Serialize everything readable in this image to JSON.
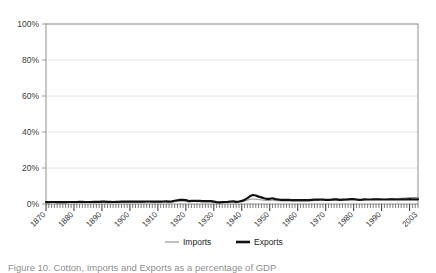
{
  "figure": {
    "caption": "Figure 10. Cotton, Imports and Exports as a percentage of GDP"
  },
  "legend": {
    "position": "bottom-center",
    "entries": [
      {
        "label": "Imports",
        "marker": "thin-line",
        "color": "#8c8c8c"
      },
      {
        "label": "Exports",
        "marker": "thick-line",
        "color": "#111111"
      }
    ]
  },
  "axes": {
    "y_ticks": [
      "0%",
      "20%",
      "40%",
      "60%",
      "80%",
      "100%"
    ],
    "x_ticks": [
      "1870",
      "1880",
      "1890",
      "1900",
      "1910",
      "1920",
      "1930",
      "1940",
      "1950",
      "1960",
      "1970",
      "1980",
      "1990",
      "2003"
    ]
  },
  "colors": {
    "imports": "#8c8c8c",
    "exports": "#111111",
    "grid": "#e2e2e2",
    "frame": "#9a9a9a",
    "text": "#3a3a3a",
    "background": "#ffffff"
  },
  "chart_data": {
    "type": "line",
    "title": "",
    "xlabel": "",
    "ylabel": "",
    "ylim": [
      0,
      100
    ],
    "xlim": [
      1870,
      2003
    ],
    "grid": true,
    "legend_position": "bottom-center",
    "y_tick_values": [
      0,
      20,
      40,
      60,
      80,
      100
    ],
    "x_tick_values": [
      1870,
      1880,
      1890,
      1900,
      1910,
      1920,
      1930,
      1940,
      1950,
      1960,
      1970,
      1980,
      1990,
      2003
    ],
    "x": [
      1870,
      1871,
      1872,
      1873,
      1874,
      1875,
      1876,
      1877,
      1878,
      1879,
      1880,
      1881,
      1882,
      1883,
      1884,
      1885,
      1886,
      1887,
      1888,
      1889,
      1890,
      1891,
      1892,
      1893,
      1894,
      1895,
      1896,
      1897,
      1898,
      1899,
      1900,
      1901,
      1902,
      1903,
      1904,
      1905,
      1906,
      1907,
      1908,
      1909,
      1910,
      1911,
      1912,
      1913,
      1914,
      1915,
      1916,
      1917,
      1918,
      1919,
      1920,
      1921,
      1922,
      1923,
      1924,
      1925,
      1926,
      1927,
      1928,
      1929,
      1930,
      1931,
      1932,
      1933,
      1934,
      1935,
      1936,
      1937,
      1938,
      1939,
      1940,
      1941,
      1942,
      1943,
      1944,
      1945,
      1946,
      1947,
      1948,
      1949,
      1950,
      1951,
      1952,
      1953,
      1954,
      1955,
      1956,
      1957,
      1958,
      1959,
      1960,
      1961,
      1962,
      1963,
      1964,
      1965,
      1966,
      1967,
      1968,
      1969,
      1970,
      1971,
      1972,
      1973,
      1974,
      1975,
      1976,
      1977,
      1978,
      1979,
      1980,
      1981,
      1982,
      1983,
      1984,
      1985,
      1986,
      1987,
      1988,
      1989,
      1990,
      1991,
      1992,
      1993,
      1994,
      1995,
      1996,
      1997,
      1998,
      1999,
      2000,
      2001,
      2002,
      2003
    ],
    "series": [
      {
        "name": "Imports",
        "color": "#8c8c8c",
        "line_width": 1,
        "values": [
          0.7,
          0.7,
          0.8,
          0.8,
          0.7,
          0.7,
          0.7,
          0.7,
          0.8,
          0.8,
          0.8,
          0.8,
          0.9,
          0.9,
          0.8,
          0.8,
          0.8,
          0.9,
          0.9,
          0.9,
          1.0,
          1.0,
          0.9,
          0.9,
          0.8,
          0.9,
          0.9,
          1.0,
          1.0,
          1.0,
          1.1,
          1.0,
          1.0,
          1.0,
          1.0,
          1.0,
          1.1,
          1.1,
          1.0,
          1.0,
          1.1,
          1.0,
          1.1,
          1.1,
          1.0,
          1.1,
          1.3,
          1.5,
          1.6,
          1.6,
          1.6,
          1.2,
          1.3,
          1.4,
          1.3,
          1.3,
          1.2,
          1.2,
          1.2,
          1.2,
          1.0,
          0.8,
          0.7,
          0.8,
          0.8,
          0.9,
          1.0,
          1.1,
          0.9,
          1.0,
          1.2,
          1.6,
          2.1,
          2.6,
          2.8,
          2.7,
          2.4,
          2.3,
          2.1,
          1.9,
          2.0,
          2.2,
          1.9,
          1.8,
          1.7,
          1.7,
          1.7,
          1.7,
          1.6,
          1.7,
          1.7,
          1.6,
          1.7,
          1.7,
          1.7,
          1.8,
          1.9,
          1.9,
          2.0,
          2.0,
          1.9,
          1.9,
          2.0,
          2.1,
          2.1,
          1.9,
          2.0,
          2.1,
          2.2,
          2.3,
          2.3,
          2.2,
          2.1,
          2.2,
          2.4,
          2.4,
          2.5,
          2.6,
          2.6,
          2.7,
          2.7,
          2.7,
          2.8,
          2.9,
          3.0,
          3.0,
          3.1,
          3.2,
          3.3,
          3.4,
          3.6,
          3.6,
          3.6,
          3.7
        ]
      },
      {
        "name": "Exports",
        "color": "#111111",
        "line_width": 2.2,
        "values": [
          1.0,
          1.0,
          1.1,
          1.1,
          1.0,
          1.0,
          1.0,
          1.0,
          1.1,
          1.1,
          1.1,
          1.1,
          1.2,
          1.2,
          1.1,
          1.1,
          1.1,
          1.2,
          1.2,
          1.2,
          1.3,
          1.3,
          1.2,
          1.2,
          1.1,
          1.2,
          1.2,
          1.3,
          1.3,
          1.3,
          1.4,
          1.3,
          1.3,
          1.3,
          1.3,
          1.3,
          1.4,
          1.4,
          1.3,
          1.3,
          1.4,
          1.3,
          1.4,
          1.5,
          1.3,
          1.5,
          1.8,
          2.1,
          2.3,
          2.3,
          2.2,
          1.6,
          1.7,
          1.8,
          1.7,
          1.7,
          1.6,
          1.6,
          1.6,
          1.6,
          1.3,
          1.0,
          0.9,
          1.0,
          1.1,
          1.2,
          1.4,
          1.5,
          1.2,
          1.4,
          1.7,
          2.3,
          3.3,
          4.4,
          5.0,
          4.7,
          4.1,
          3.7,
          3.2,
          2.8,
          2.9,
          3.2,
          2.7,
          2.5,
          2.3,
          2.3,
          2.3,
          2.3,
          2.1,
          2.2,
          2.2,
          2.1,
          2.2,
          2.2,
          2.2,
          2.3,
          2.4,
          2.4,
          2.5,
          2.5,
          2.3,
          2.3,
          2.4,
          2.6,
          2.6,
          2.3,
          2.4,
          2.5,
          2.6,
          2.7,
          2.7,
          2.5,
          2.3,
          2.4,
          2.6,
          2.5,
          2.5,
          2.6,
          2.6,
          2.6,
          2.5,
          2.5,
          2.5,
          2.6,
          2.6,
          2.5,
          2.5,
          2.6,
          2.6,
          2.6,
          2.7,
          2.6,
          2.6,
          2.6
        ]
      }
    ]
  }
}
